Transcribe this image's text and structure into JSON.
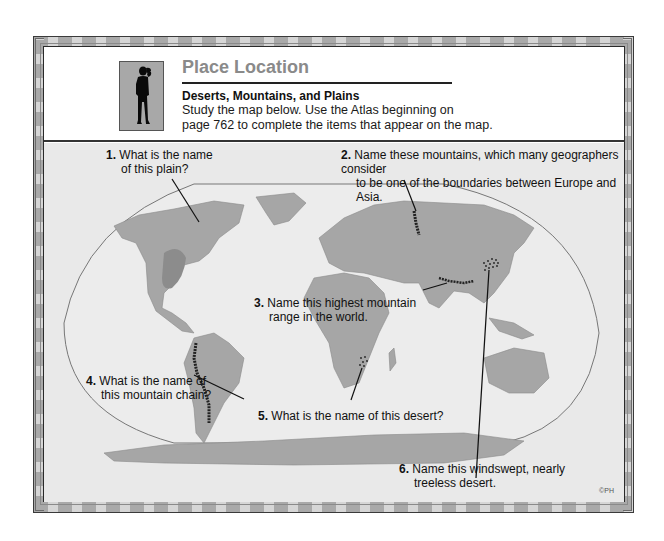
{
  "header": {
    "title": "Place Location",
    "subtitle": "Deserts, Mountains, and Plains",
    "instructions_line1": "Study the map below.  Use the Atlas beginning on",
    "instructions_line2": "page 762 to complete the items that appear on the map.",
    "icon": "person-silhouette-icon"
  },
  "questions": [
    {
      "number": "1.",
      "line1": "What is the name",
      "line2": "of this plain?"
    },
    {
      "number": "2.",
      "line1": "Name these mountains, which many geographers consider",
      "line2": "to be one of the boundaries between Europe and Asia."
    },
    {
      "number": "3.",
      "line1": "Name this highest mountain",
      "line2": "range in the world."
    },
    {
      "number": "4.",
      "line1": "What is the name of",
      "line2": "this mountain chain?"
    },
    {
      "number": "5.",
      "line1": "What is the name of this desert?",
      "line2": ""
    },
    {
      "number": "6.",
      "line1": "Name this windswept, nearly",
      "line2": "treeless desert."
    }
  ],
  "copyright": "©PH",
  "colors": {
    "ocean": "#e9e9e9",
    "land": "#a6a6a6",
    "plain_highlight": "#8c8c8c",
    "title_gray": "#8a8a8a",
    "frame_dark": "#a9a9a9",
    "frame_light": "#d6d6d6"
  }
}
